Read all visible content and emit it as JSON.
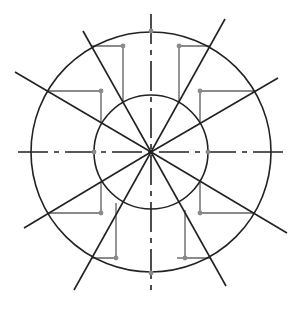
{
  "diagram": {
    "title": "",
    "center": {
      "x": 151,
      "y": 152
    },
    "outer_radius": 120,
    "inner_radius": 57,
    "colors": {
      "stroke": "#222222",
      "construction": "#8a8a8a",
      "background": "#ffffff"
    },
    "centerlines": {
      "horizontal": {
        "x1": 18,
        "y1": 152,
        "x2": 283,
        "y2": 152
      },
      "vertical": {
        "x1": 151,
        "y1": 14,
        "x2": 151,
        "y2": 290
      },
      "dash_pattern": "30 6 5 6"
    },
    "radial_lines": [
      {
        "angle": 30,
        "x2": 278,
        "y2": 78
      },
      {
        "angle": 60,
        "x2": 225,
        "y2": 19
      },
      {
        "angle": 120,
        "x2": 83,
        "y2": 31
      },
      {
        "angle": 150,
        "x2": 15,
        "y2": 72
      },
      {
        "angle": 210,
        "x2": 24,
        "y2": 228
      },
      {
        "angle": 240,
        "x2": 74,
        "y2": 290
      },
      {
        "angle": 300,
        "x2": 226,
        "y2": 286
      },
      {
        "angle": 330,
        "x2": 287,
        "y2": 233
      }
    ],
    "construction_steps": [
      {
        "points": [
          [
            210,
            46
          ],
          [
            179,
            46
          ],
          [
            179,
            102
          ]
        ],
        "dot": [
          179,
          46
        ]
      },
      {
        "points": [
          [
            254,
            91
          ],
          [
            200,
            91
          ],
          [
            200,
            124
          ]
        ],
        "dot": [
          200,
          91
        ]
      },
      {
        "points": [
          [
            92,
            46
          ],
          [
            123,
            46
          ],
          [
            123,
            102
          ]
        ],
        "dot": [
          123,
          46
        ]
      },
      {
        "points": [
          [
            49,
            91
          ],
          [
            101,
            91
          ],
          [
            101,
            123
          ]
        ],
        "dot": [
          101,
          91
        ]
      },
      {
        "points": [
          [
            200,
            181
          ],
          [
            200,
            213
          ],
          [
            254,
            213
          ]
        ],
        "dot": [
          200,
          213
        ]
      },
      {
        "points": [
          [
            185,
            210
          ],
          [
            185,
            258
          ],
          [
            210,
            258
          ]
        ],
        "extra": [
          [
            177,
            258
          ],
          [
            185,
            258
          ]
        ],
        "dot": [
          185,
          258
        ]
      },
      {
        "points": [
          [
            101,
            182
          ],
          [
            101,
            213
          ],
          [
            48,
            213
          ]
        ],
        "dot": [
          101,
          213
        ]
      },
      {
        "points": [
          [
            116,
            203
          ],
          [
            116,
            258
          ],
          [
            92,
            258
          ]
        ],
        "dot": [
          116,
          258
        ]
      }
    ],
    "axis_dots": [
      [
        151,
        31
      ],
      [
        151,
        273
      ],
      [
        94,
        152
      ],
      [
        208,
        152
      ]
    ]
  }
}
